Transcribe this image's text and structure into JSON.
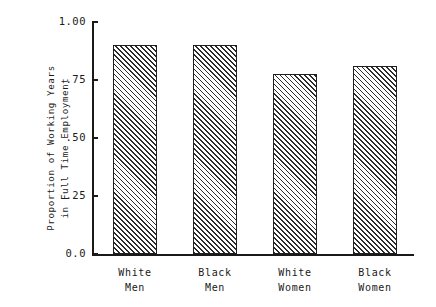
{
  "chart_data": {
    "type": "bar",
    "title": "",
    "subtitle": "",
    "xlabel": "",
    "ylabel": "Proportion of Working Years in Full Time Employment",
    "ylabel_lines": [
      "Proportion of Working Years",
      "in Full Time Employment"
    ],
    "categories": [
      "White Men",
      "Black Men",
      "White Women",
      "Black Women"
    ],
    "category_lines": [
      [
        "White",
        "Men"
      ],
      [
        "Black",
        "Men"
      ],
      [
        "White",
        "Women"
      ],
      [
        "Black",
        "Women"
      ]
    ],
    "values": [
      0.9,
      0.9,
      0.775,
      0.81
    ],
    "ylim": [
      0.0,
      1.0
    ],
    "yticks": [
      0.0,
      0.25,
      0.5,
      0.75,
      1.0
    ],
    "ytick_labels": [
      "0.0",
      ".25",
      ".50",
      ".75",
      "1.00"
    ],
    "grid": false,
    "legend": false,
    "legend_position": "none",
    "bar_fill": "diagonal-hatch",
    "colors": {
      "axis": "#1a1a1a",
      "bar_edge": "#1f1f1f",
      "bar_hatch": "#2b2b2b",
      "bar_background": "#ffffff",
      "page_background": "#ffffff"
    }
  }
}
